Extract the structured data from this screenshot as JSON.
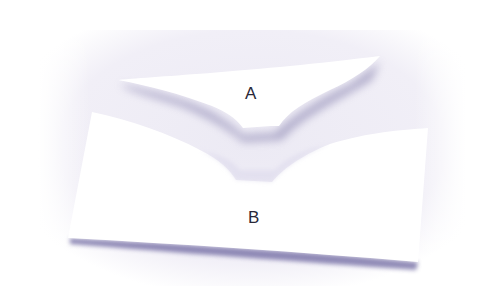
{
  "image": {
    "description": "Photo of two curved paper cutouts on a light lavender surface (Jastrow-style illusion)",
    "background_color": "#f0eef6",
    "paper_color": "#ffffff",
    "shadow_color": "#7e78a8"
  },
  "shapes": [
    {
      "id": "A",
      "label": "A"
    },
    {
      "id": "B",
      "label": "B"
    }
  ]
}
